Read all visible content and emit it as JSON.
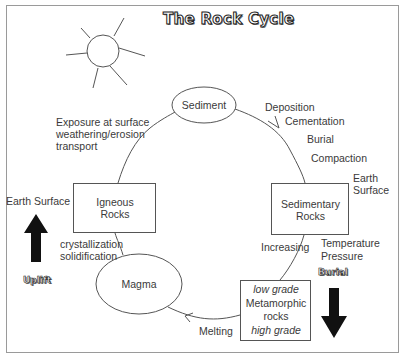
{
  "title": "The Rock Cycle",
  "nodes": {
    "sediment": {
      "label": "Sediment"
    },
    "igneous": {
      "line1": "Igneous",
      "line2": "Rocks"
    },
    "sedimentary": {
      "line1": "Sedimentary",
      "line2": "Rocks"
    },
    "magma": {
      "label": "Magma"
    },
    "metamorphic": {
      "line1": "low grade",
      "line2": "Metamorphic",
      "line3": "rocks",
      "line4": "high grade"
    }
  },
  "processes": {
    "exposure": [
      "Exposure at surface",
      "weathering/erosion",
      "transport"
    ],
    "deposition": "Deposition",
    "cementation": "Cementation",
    "burial_step": "Burial",
    "compaction": "Compaction",
    "crystallization": [
      "crystallization",
      "solidification"
    ],
    "increasing": "Increasing",
    "temperature": "Temperature",
    "pressure": "Pressure",
    "melting": "Melting"
  },
  "surface_labels": {
    "left_earth_surface": "Earth Surface",
    "right_earth_surface": [
      "Earth",
      "Surface"
    ]
  },
  "arrows": {
    "uplift": {
      "label": "Uplift",
      "direction": "up"
    },
    "burial": {
      "label": "Burial",
      "direction": "down"
    }
  },
  "decorations": {
    "sun": "sun-icon"
  },
  "colors": {
    "line": "#555555",
    "text": "#3a3a3a",
    "arrow_fill": "#111111",
    "frame": "#999999",
    "background": "#ffffff"
  }
}
